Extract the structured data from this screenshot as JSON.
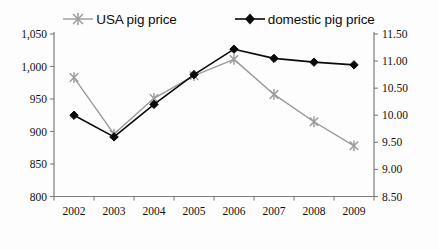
{
  "chart_data": {
    "type": "line",
    "title": "",
    "subtitle": "",
    "xlabel": "",
    "ylabel": "",
    "grid": false,
    "legend_position": "top",
    "categories": [
      "2002",
      "2003",
      "2004",
      "2005",
      "2006",
      "2007",
      "2008",
      "2009"
    ],
    "axes": {
      "x": {
        "type": "category",
        "tick_labels": [
          "2002",
          "2003",
          "2004",
          "2005",
          "2006",
          "2007",
          "2008",
          "2009"
        ]
      },
      "y_left": {
        "label": "",
        "ylim": [
          800,
          1050
        ],
        "tick_step": 50,
        "tick_labels": [
          "1,050",
          "1,000",
          "950",
          "900",
          "850",
          "800"
        ],
        "tick_values": [
          1050,
          1000,
          950,
          900,
          850,
          800
        ]
      },
      "y_right": {
        "label": "",
        "ylim": [
          8.5,
          11.5
        ],
        "tick_step": 0.5,
        "tick_labels": [
          "11.50",
          "11.00",
          "10.50",
          "10.00",
          "9.50",
          "9.00",
          "8.50"
        ],
        "tick_values": [
          11.5,
          11.0,
          10.5,
          10.0,
          9.5,
          9.0,
          8.5
        ]
      }
    },
    "series": [
      {
        "name": "USA pig price",
        "axis": "y_left",
        "color": "#9a9a9a",
        "marker": "cross-star",
        "values": [
          983,
          896,
          951,
          986,
          1011,
          957,
          915,
          878
        ]
      },
      {
        "name": "domestic pig price",
        "axis": "y_right",
        "color": "#0a0a0a",
        "marker": "diamond",
        "values": [
          10.0,
          9.6,
          10.2,
          10.75,
          11.22,
          11.05,
          10.98,
          10.93
        ]
      }
    ]
  },
  "legend": {
    "items": [
      {
        "label": "USA pig price",
        "color": "#9a9a9a",
        "marker": "cross-star"
      },
      {
        "label": "domestic pig price",
        "color": "#0a0a0a",
        "marker": "diamond"
      }
    ]
  },
  "colors": {
    "usa_series": "#9a9a9a",
    "domestic_series": "#0a0a0a",
    "axis": "#7d7d7d",
    "text": "#111111",
    "background": "#fdfdfd"
  }
}
